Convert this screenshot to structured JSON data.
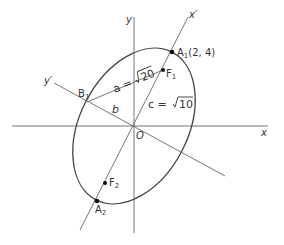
{
  "diagram": {
    "axes": {
      "x_label": "x",
      "y_label": "y",
      "x_prime_label": "x′",
      "y_prime_label": "y′",
      "origin_label": "O"
    },
    "points": {
      "A1": {
        "name": "A",
        "sub": "1",
        "coords": "(2, 4)"
      },
      "A2": {
        "name": "A",
        "sub": "2"
      },
      "F1": {
        "name": "F",
        "sub": "1"
      },
      "F2": {
        "name": "F",
        "sub": "2"
      },
      "B1": {
        "name": "B",
        "sub": "1"
      }
    },
    "segments": {
      "a_label": "a =",
      "a_value": "20",
      "b_label": "b",
      "c_label": "c =",
      "c_value": "10"
    },
    "colors": {
      "line": "#555555",
      "curve": "#444444",
      "text": "#333333"
    }
  }
}
